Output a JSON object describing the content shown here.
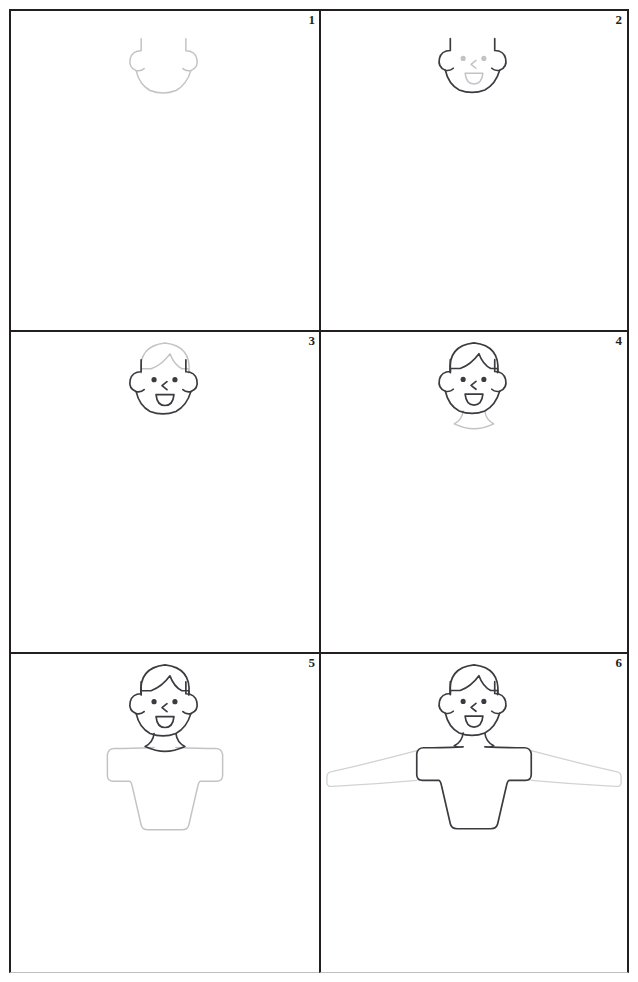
{
  "sheet": {
    "title": "How to draw a boy - 6 step grid worksheet",
    "background_color": "#ffffff",
    "border_color": "#231f20",
    "new_stroke_color": "#c3c3c6",
    "old_stroke_color": "#3b3b40",
    "columns": 2,
    "rows": 3
  },
  "panels": [
    {
      "number": "1",
      "step_label": "Step 1",
      "description": "Draw the lower head outline: rounded jaw with two small ears on the sides",
      "new_parts": [
        "jaw-outline",
        "left-ear",
        "right-ear"
      ],
      "existing_parts": []
    },
    {
      "number": "2",
      "step_label": "Step 2",
      "description": "Add the face: two dot eyes, a small angled nose and an open smiling mouth",
      "new_parts": [
        "left-eye",
        "right-eye",
        "nose",
        "mouth"
      ],
      "existing_parts": [
        "jaw-outline",
        "left-ear",
        "right-ear"
      ]
    },
    {
      "number": "3",
      "step_label": "Step 3",
      "description": "Add the hair: a rounded dome over the head with a zigzag fringe across the forehead",
      "new_parts": [
        "hair-dome",
        "hair-fringe"
      ],
      "existing_parts": [
        "jaw-outline",
        "left-ear",
        "right-ear",
        "left-eye",
        "right-eye",
        "nose",
        "mouth"
      ]
    },
    {
      "number": "4",
      "step_label": "Step 4",
      "description": "Add the neck under the chin",
      "new_parts": [
        "neck"
      ],
      "existing_parts": [
        "head",
        "face",
        "hair"
      ]
    },
    {
      "number": "5",
      "step_label": "Step 5",
      "description": "Add the body: a wide t-shirt shape with shoulders and tapered torso",
      "new_parts": [
        "torso-tshirt"
      ],
      "existing_parts": [
        "head",
        "face",
        "hair",
        "neck"
      ]
    },
    {
      "number": "6",
      "step_label": "Step 6",
      "description": "Add the arms stretched out to both sides",
      "new_parts": [
        "left-arm",
        "right-arm"
      ],
      "existing_parts": [
        "head",
        "face",
        "hair",
        "neck",
        "torso-tshirt"
      ]
    }
  ]
}
